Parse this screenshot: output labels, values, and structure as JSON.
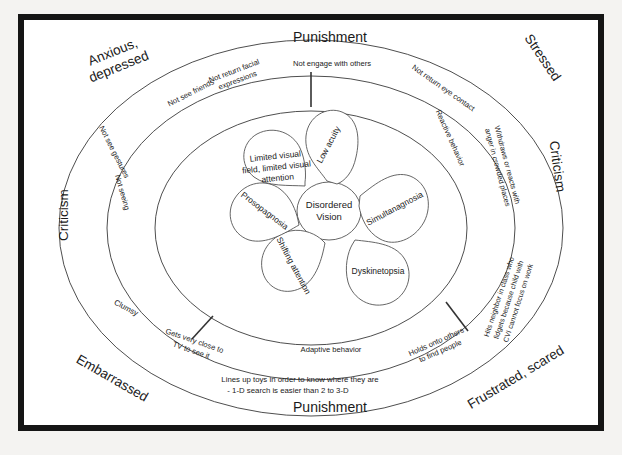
{
  "figure": {
    "title_top": "Punishment",
    "title_bottom": "Punishment",
    "center": {
      "label": "Disordered Vision",
      "line1": "Disordered",
      "line2": "Vision"
    },
    "petals": [
      {
        "id": "low-acuity",
        "label": "Low acuity"
      },
      {
        "id": "simultanagnosia",
        "label": "Simultanagnosia"
      },
      {
        "id": "dyskinetopsia",
        "label": "Dyskinetopsia"
      },
      {
        "id": "shifting-attention",
        "label": "Shifting attention"
      },
      {
        "id": "prosopagnosia",
        "label": "Prosopagnosia"
      },
      {
        "id": "limited-visual-field",
        "label": "Limited visual field, limited visual attention",
        "line1": "Limited visual",
        "line2": "field, limited visual",
        "line3": "attention"
      }
    ],
    "middle_ring": {
      "name": "Adaptive behavior ring",
      "labels": [
        {
          "id": "not-seeing",
          "text": "Not seeing"
        },
        {
          "id": "not-see-friends",
          "text": "Not see friends"
        },
        {
          "id": "not-engage-with-others",
          "text": "Not engage with others"
        },
        {
          "id": "reactive-behavior",
          "text": "Reactive behavior"
        },
        {
          "id": "holds-onto-others",
          "text": "Holds onto others to find people",
          "line1": "Holds onto others",
          "line2": "to find people"
        },
        {
          "id": "adaptive-behavior",
          "text": "Adaptive behavior"
        },
        {
          "id": "gets-very-close-to-tv",
          "text": "Gets very close to TV to see it",
          "line1": "Gets very close to",
          "line2": "TV to see it"
        }
      ]
    },
    "outer_ring": {
      "name": "Consequence ring",
      "labels": [
        {
          "id": "not-see-gestures",
          "text": "Not see gestures"
        },
        {
          "id": "not-return-facial-expressions",
          "text": "Not return facial expressions",
          "line1": "Not return facial",
          "line2": "expressions"
        },
        {
          "id": "not-return-eye-contact",
          "text": "Not return eye contact"
        },
        {
          "id": "withdraws-or-reacts",
          "text": "Withdraws or reacts with anger in crowded places",
          "line1": "Withdraws or reacts with",
          "line2": "anger in crowded places"
        },
        {
          "id": "hits-neighbor-in-class",
          "text": "Hits neighbor in class who fidgets because child with CVI cannot focus on work",
          "line1": "Hits neighbor in class who",
          "line2": "fidgets because child with",
          "line3": "CVI cannot focus on work"
        },
        {
          "id": "lines-up-toys",
          "text": "Lines up toys in order to know where they are - 1-D search is easier than 2 to 3-D",
          "line1": "Lines up toys in order to know where they are",
          "line2": "- 1-D search is easier  than 2 to 3-D"
        },
        {
          "id": "clumsy",
          "text": "Clumsy"
        }
      ]
    },
    "corner_labels": [
      {
        "id": "anxious-depressed",
        "text": "Anxious, depressed",
        "line1": "Anxious,",
        "line2": "depressed"
      },
      {
        "id": "stressed",
        "text": "Stressed"
      },
      {
        "id": "criticism-right",
        "text": "Criticism"
      },
      {
        "id": "frustrated-scared",
        "text": "Frustrated, scared"
      },
      {
        "id": "embarrassed",
        "text": "Embarrassed"
      },
      {
        "id": "criticism-left",
        "text": "Criticism"
      }
    ],
    "colors": {
      "frame": "#151515",
      "stroke": "#3a3a3a",
      "text": "#1a1a1a",
      "background": "#ffffff"
    }
  }
}
